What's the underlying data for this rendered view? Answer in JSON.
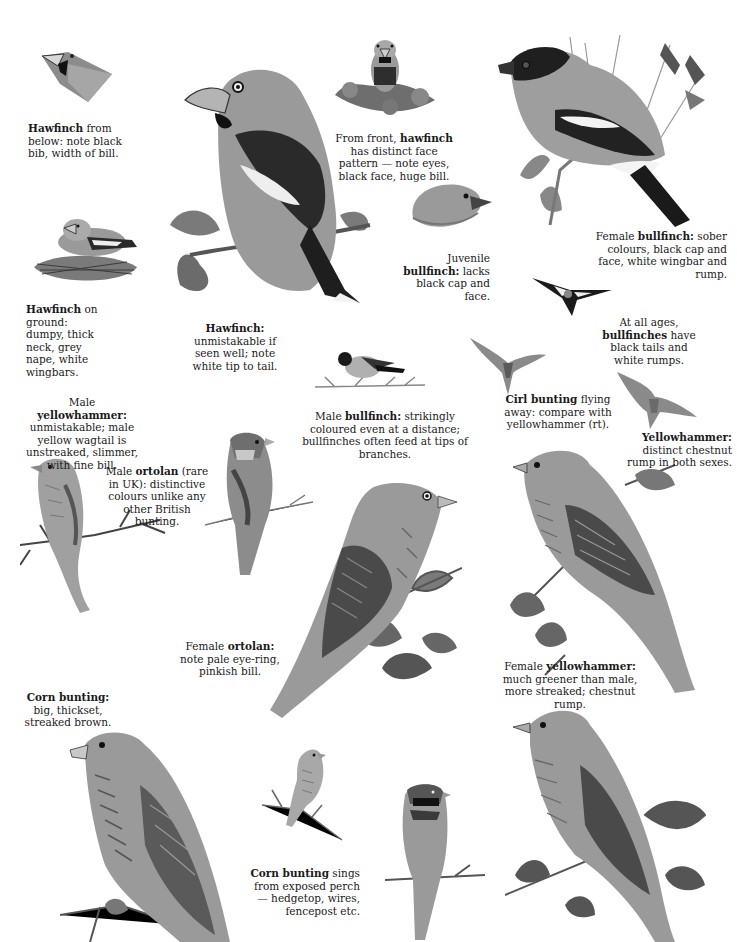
{
  "page": {
    "style": "grayscale illustrated plate"
  },
  "captions": [
    {
      "id": "hawfinch-below",
      "bold": "Hawfinch",
      "text": " from below: note black bib, width of bill."
    },
    {
      "id": "hawfinch-front",
      "pre": "From front, ",
      "bold": "hawfinch",
      "text": " has distinct face pattern — note eyes, black face, huge bill."
    },
    {
      "id": "female-bullfinch",
      "pre": "Female ",
      "bold": "bullfinch:",
      "text": " sober colours, black cap and face, white wingbar and rump."
    },
    {
      "id": "juvenile-bullfinch",
      "pre": "Juvenile ",
      "bold": "bullfinch:",
      "text": " lacks black cap and face."
    },
    {
      "id": "hawfinch-ground",
      "bold": "Hawfinch",
      "text": " on ground: dumpy, thick neck, grey nape, white wingbars."
    },
    {
      "id": "hawfinch-main",
      "bold": "Hawfinch:",
      "text": " unmistakable if seen well; note white tip to tail."
    },
    {
      "id": "bullfinch-ages",
      "pre": "At all ages, ",
      "bold": "bullfinches",
      "text": " have black tails and white rumps."
    },
    {
      "id": "cirl-flying",
      "bold": "Cirl bunting",
      "text": " flying away: compare with yellowhammer (rt)."
    },
    {
      "id": "yellowhammer-rump",
      "bold": "Yellowhammer:",
      "text": " distinct chestnut rump in both sexes."
    },
    {
      "id": "male-yellowhammer",
      "pre": "Male ",
      "bold": "yellowhammer:",
      "text": " unmistakable; male yellow wagtail is unstreaked, slimmer, with fine bill."
    },
    {
      "id": "male-ortolan",
      "pre": "Male ",
      "bold": "ortolan",
      "text": " (rare in UK): distinctive colours unlike any other British bunting."
    },
    {
      "id": "male-bullfinch",
      "pre": "Male ",
      "bold": "bullfinch:",
      "text": " strikingly coloured even at a distance; bullfinches often feed at tips of branches."
    },
    {
      "id": "female-ortolan",
      "pre": "Female ",
      "bold": "ortolan:",
      "text": " note pale eye-ring, pinkish bill."
    },
    {
      "id": "female-yellowhammer",
      "pre": "Female ",
      "bold": "yellowhammer:",
      "text": " much greener than male, more streaked; chestnut rump."
    },
    {
      "id": "corn-bunting",
      "bold": "Corn bunting:",
      "text": " big, thickset, streaked brown."
    },
    {
      "id": "corn-bunting-sings",
      "bold": "Corn bunting",
      "text": " sings from exposed perch — hedgetop, wires, fencepost etc."
    }
  ],
  "illustrations": [
    {
      "id": "hawfinch-head-below",
      "label": "Hawfinch head from below"
    },
    {
      "id": "hawfinch-large",
      "label": "Hawfinch perched"
    },
    {
      "id": "hawfinch-front-small",
      "label": "Hawfinch from front"
    },
    {
      "id": "female-bullfinch-large",
      "label": "Female bullfinch perched"
    },
    {
      "id": "hawfinch-nest",
      "label": "Hawfinch on ground"
    },
    {
      "id": "juvenile-bullfinch-head",
      "label": "Juvenile bullfinch head"
    },
    {
      "id": "bullfinch-flying",
      "label": "Bullfinch in flight"
    },
    {
      "id": "male-bullfinch-small",
      "label": "Male bullfinch on branch"
    },
    {
      "id": "cirl-bunting-flight",
      "label": "Cirl bunting in flight"
    },
    {
      "id": "yellowhammer-flight",
      "label": "Yellowhammer in flight"
    },
    {
      "id": "male-yellowhammer-perched",
      "label": "Male yellowhammer"
    },
    {
      "id": "male-ortolan-perched",
      "label": "Male ortolan"
    },
    {
      "id": "female-ortolan-large",
      "label": "Female ortolan"
    },
    {
      "id": "female-yellowhammer-large",
      "label": "Female yellowhammer"
    },
    {
      "id": "corn-bunting-large",
      "label": "Corn bunting"
    },
    {
      "id": "corn-bunting-small",
      "label": "Corn bunting singing"
    },
    {
      "id": "cirl-bunting-male",
      "label": "Male cirl bunting"
    },
    {
      "id": "cirl-bunting-female",
      "label": "Female cirl bunting"
    }
  ]
}
